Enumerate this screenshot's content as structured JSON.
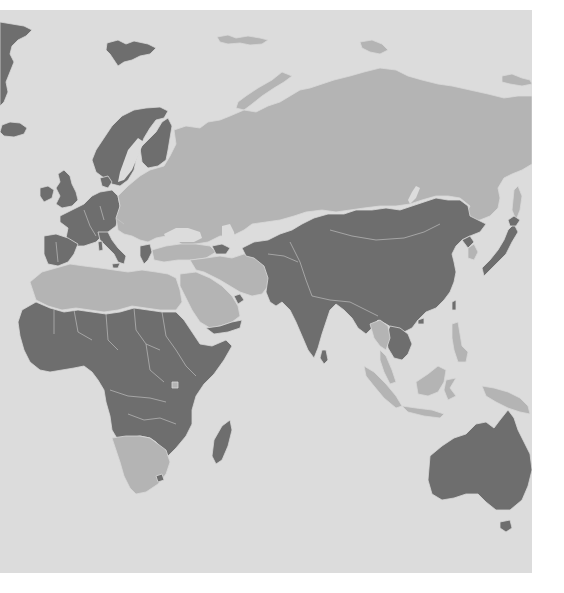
{
  "map": {
    "type": "choropleth",
    "projection": "equirectangular-like",
    "extent": "Eastern Hemisphere (Europe, Africa, Asia, Oceania)",
    "colors": {
      "ocean": "#dcdcdc",
      "page_background": "#ffffff",
      "category_dark": "#6e6e6e",
      "category_light": "#b4b4b4",
      "border": "#d8d8d8"
    },
    "categories": {
      "dark": [
        "Greenland (edge)",
        "Iceland",
        "Svalbard",
        "Norway",
        "Sweden",
        "Finland",
        "United Kingdom",
        "Ireland",
        "France",
        "Spain",
        "Portugal",
        "Germany",
        "Italy",
        "Benelux",
        "Central Europe",
        "Greece",
        "Denmark",
        "Turkmenistan",
        "Afghanistan",
        "Pakistan",
        "India",
        "China",
        "Mongolia",
        "Nepal",
        "Myanmar",
        "Vietnam",
        "North Korea",
        "Japan",
        "Sri Lanka",
        "Yemen",
        "UAE / Qatar",
        "West Africa",
        "Sahel",
        "Central Africa",
        "East Africa",
        "Ethiopia",
        "Somalia",
        "Angola",
        "Zambia",
        "Mozambique",
        "Madagascar",
        "Australia",
        "Tasmania"
      ],
      "light": [
        "Russia",
        "Eastern Europe",
        "Belarus / Ukraine",
        "Kazakhstan",
        "Turkey",
        "Iran",
        "Saudi Arabia",
        "Iraq / Syria",
        "Morocco / Algeria",
        "Libya",
        "Egypt",
        "Namibia / Botswana / South Africa",
        "Gabon",
        "South Korea",
        "Thailand",
        "Malaysia",
        "Indonesia",
        "Philippines",
        "Papua New Guinea",
        "Russian Far East islands"
      ]
    },
    "legend": null,
    "labels": []
  }
}
